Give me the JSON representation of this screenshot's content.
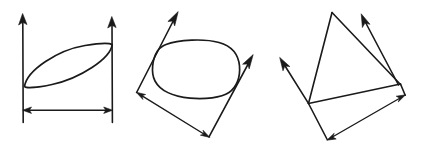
{
  "figure": {
    "background_color": "#ffffff",
    "ink_color": "#1a1a1a",
    "width": 427,
    "height": 155,
    "panel_count": 3
  },
  "panels": [
    {
      "id": "panel-1",
      "name": "tilted-lens-between-parallel-axes",
      "description": "Two vertical arrows with a tilted narrow ellipse spanning between them and a horizontal double-headed dimension line below",
      "elements": [
        {
          "name": "left-vertical-arrow",
          "kind": "arrow",
          "from": [
            23,
            122
          ],
          "to": [
            23,
            14
          ],
          "arrowheads": "end"
        },
        {
          "name": "right-vertical-arrow",
          "kind": "arrow",
          "from": [
            112,
            122
          ],
          "to": [
            112,
            17
          ],
          "arrowheads": "end"
        },
        {
          "name": "tilted-ellipse",
          "kind": "closed-curve",
          "left_anchor": [
            24,
            86
          ],
          "right_anchor": [
            112,
            44
          ]
        },
        {
          "name": "horizontal-dimension-line",
          "kind": "arrow",
          "from": [
            23,
            110
          ],
          "to": [
            112,
            110
          ],
          "arrowheads": "both"
        }
      ]
    },
    {
      "id": "panel-2",
      "name": "rounded-blob-between-oblique-axes",
      "description": "Two oblique arrows pointing up-right with a rounded quadrilateral blob between them and an oblique double-headed dimension line below",
      "elements": [
        {
          "name": "left-oblique-arrow",
          "kind": "arrow",
          "from": [
            137,
            92
          ],
          "to": [
            178,
            12
          ],
          "arrowheads": "end"
        },
        {
          "name": "right-oblique-arrow",
          "kind": "arrow",
          "from": [
            209,
            137
          ],
          "to": [
            253,
            55
          ],
          "arrowheads": "end"
        },
        {
          "name": "rounded-blob",
          "kind": "closed-curve",
          "bounds": [
            153,
            40,
            240,
            99
          ]
        },
        {
          "name": "oblique-dimension-line",
          "kind": "arrow",
          "from": [
            137,
            92
          ],
          "to": [
            209,
            137
          ],
          "arrowheads": "both"
        }
      ]
    },
    {
      "id": "panel-3",
      "name": "triangle-with-oblique-axes",
      "description": "A triangle formed by three lines with two arrows pointing up-left and up-right and an oblique double-headed dimension line below",
      "elements": [
        {
          "name": "triangle-apex-left-edge",
          "kind": "line",
          "from": [
            308,
            103
          ],
          "to": [
            332,
            12
          ]
        },
        {
          "name": "triangle-apex-right-edge",
          "kind": "line",
          "from": [
            332,
            12
          ],
          "to": [
            400,
            84
          ]
        },
        {
          "name": "triangle-base-edge",
          "kind": "line",
          "from": [
            308,
            103
          ],
          "to": [
            400,
            84
          ]
        },
        {
          "name": "left-oblique-arrow",
          "kind": "arrow",
          "from": [
            308,
            103
          ],
          "to": [
            280,
            58
          ],
          "arrowheads": "end"
        },
        {
          "name": "right-oblique-arrow",
          "kind": "arrow",
          "from": [
            398,
            85
          ],
          "to": [
            361,
            14
          ],
          "arrowheads": "end"
        },
        {
          "name": "oblique-dimension-line",
          "kind": "arrow",
          "from": [
            327,
            140
          ],
          "to": [
            405,
            95
          ],
          "arrowheads": "both"
        },
        {
          "name": "dimension-connector-left",
          "kind": "line",
          "from": [
            308,
            103
          ],
          "to": [
            327,
            140
          ]
        },
        {
          "name": "dimension-connector-right",
          "kind": "line",
          "from": [
            400,
            84
          ],
          "to": [
            405,
            95
          ]
        }
      ]
    }
  ]
}
